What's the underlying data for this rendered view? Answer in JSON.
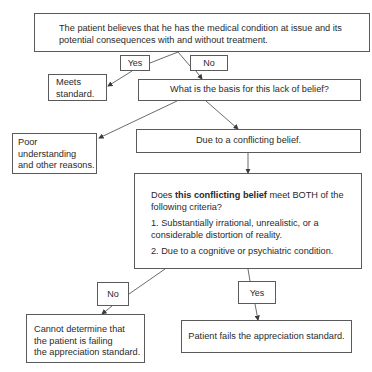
{
  "diagram": {
    "type": "flowchart",
    "nodes": {
      "premise": {
        "line1": "The patient believes that he has the medical condition at issue and its",
        "line2": "potential consequences with and without treatment."
      },
      "yes_top": "Yes",
      "no_top": "No",
      "meets": {
        "line1": "Meets",
        "line2": "standard."
      },
      "basis_question": "What is the basis for this lack of belief?",
      "poor": {
        "line1": "Poor",
        "line2": "understanding",
        "line3": "and other reasons."
      },
      "conflicting": "Due to a conflicting belief.",
      "criteria": {
        "q_prefix": "Does ",
        "q_bold": "this conflicting belief",
        "q_suffix": " meet BOTH of the",
        "q_line2": "following criteria?",
        "c1_line1": "1.  Substantially irrational, unrealistic, or a",
        "c1_line2": "considerable distortion of reality.",
        "c2": "2.  Due to a cognitive or psychiatric condition."
      },
      "no_bottom": "No",
      "yes_bottom": "Yes",
      "cannot": {
        "line1": "Cannot determine that",
        "line2": "the patient is failing",
        "line3": "the appreciation standard."
      },
      "fails": "Patient fails the appreciation standard."
    },
    "colors": {
      "line": "#5a5a5a",
      "text": "#2a2a2a",
      "background": "#ffffff"
    }
  }
}
